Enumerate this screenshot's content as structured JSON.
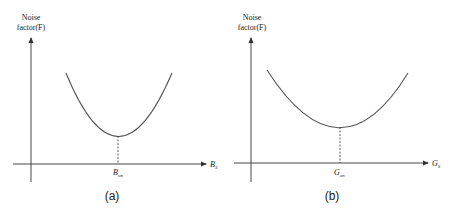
{
  "figures": [
    {
      "id": "a",
      "caption": "(a)",
      "y_axis_label_line1": "Noise",
      "y_axis_label_line2": "factor(F)",
      "x_axis_label_main": "B",
      "x_axis_label_sub": "S",
      "optimum_label_main": "B",
      "optimum_label_sub": "on"
    },
    {
      "id": "b",
      "caption": "(b)",
      "y_axis_label_line1": "Noise",
      "y_axis_label_line2": "factor(F)",
      "x_axis_label_main": "G",
      "x_axis_label_sub": "S",
      "optimum_label_main": "G",
      "optimum_label_sub": "on"
    }
  ],
  "colors": {
    "axis": "#333333",
    "curve": "#555555",
    "text": "#222222"
  }
}
